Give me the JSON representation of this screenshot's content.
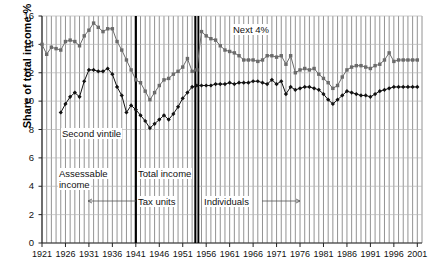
{
  "chart_data": {
    "type": "line",
    "title": "",
    "xlabel": "",
    "ylabel": "Share of total income %",
    "xlim": [
      1921,
      2002
    ],
    "ylim": [
      0,
      16
    ],
    "ytick_step": 2,
    "yticks": [
      "0",
      "2",
      "4",
      "6",
      "8",
      "10",
      "12",
      "14",
      "16"
    ],
    "xticks": [
      "1921",
      "1926",
      "1931",
      "1936",
      "1941",
      "1946",
      "1951",
      "1956",
      "1961",
      "1966",
      "1971",
      "1976",
      "1981",
      "1986",
      "1991",
      "1996",
      "2001"
    ],
    "grid": "vertical yearly gridlines plus horizontal gridlines at every y tick",
    "legend_position": "inline labels on series",
    "series": [
      {
        "name": "Next 4%",
        "marker": "square",
        "color": "#6b6b6b",
        "x": [
          1921,
          1922,
          1923,
          1924,
          1925,
          1926,
          1927,
          1928,
          1929,
          1930,
          1931,
          1932,
          1933,
          1934,
          1935,
          1936,
          1937,
          1938,
          1939,
          1940,
          1941,
          1942,
          1943,
          1944,
          1945,
          1946,
          1947,
          1948,
          1949,
          1950,
          1951,
          1952,
          1953,
          1954,
          1955,
          1956,
          1957,
          1958,
          1959,
          1960,
          1961,
          1962,
          1963,
          1964,
          1965,
          1966,
          1967,
          1968,
          1969,
          1970,
          1971,
          1972,
          1973,
          1974,
          1975,
          1976,
          1977,
          1978,
          1979,
          1980,
          1981,
          1982,
          1983,
          1984,
          1985,
          1986,
          1987,
          1988,
          1989,
          1990,
          1991,
          1992,
          1993,
          1994,
          1995,
          1996,
          1997,
          1998,
          1999,
          2000,
          2001
        ],
        "values": [
          14.0,
          13.3,
          13.8,
          13.7,
          13.6,
          14.2,
          14.3,
          14.2,
          13.9,
          14.6,
          15.0,
          15.5,
          15.2,
          14.9,
          15.1,
          15.1,
          14.2,
          13.6,
          12.9,
          12.2,
          11.5,
          11.3,
          10.7,
          10.1,
          10.6,
          11.1,
          11.5,
          11.6,
          11.9,
          12.1,
          12.4,
          13.0,
          12.1,
          12.2,
          14.9,
          14.6,
          14.4,
          14.3,
          13.9,
          13.6,
          13.5,
          13.4,
          13.2,
          12.9,
          12.9,
          12.9,
          12.8,
          12.9,
          13.2,
          13.2,
          13.1,
          13.2,
          12.6,
          13.2,
          12.0,
          12.2,
          12.3,
          12.2,
          12.3,
          11.9,
          11.6,
          11.3,
          10.9,
          11.1,
          11.7,
          12.2,
          12.4,
          12.5,
          12.5,
          12.4,
          12.3,
          12.5,
          12.6,
          12.9,
          13.4,
          12.8,
          12.9,
          12.9,
          12.9,
          12.9,
          12.9
        ]
      },
      {
        "name": "Second vintile",
        "marker": "diamond",
        "color": "#111111",
        "x": [
          1925,
          1926,
          1927,
          1928,
          1929,
          1930,
          1931,
          1932,
          1933,
          1934,
          1935,
          1936,
          1937,
          1938,
          1939,
          1940,
          1941,
          1942,
          1943,
          1944,
          1945,
          1946,
          1947,
          1948,
          1949,
          1950,
          1951,
          1952,
          1953,
          1954,
          1955,
          1956,
          1957,
          1958,
          1959,
          1960,
          1961,
          1962,
          1963,
          1964,
          1965,
          1966,
          1967,
          1968,
          1969,
          1970,
          1971,
          1972,
          1973,
          1974,
          1975,
          1976,
          1977,
          1978,
          1979,
          1980,
          1981,
          1982,
          1983,
          1984,
          1985,
          1986,
          1987,
          1988,
          1989,
          1990,
          1991,
          1992,
          1993,
          1994,
          1995,
          1996,
          1997,
          1998,
          1999,
          2000,
          2001
        ],
        "values": [
          9.2,
          9.8,
          10.3,
          10.6,
          10.3,
          11.4,
          12.2,
          12.2,
          12.1,
          12.1,
          12.3,
          11.9,
          11.0,
          10.4,
          9.2,
          9.7,
          9.4,
          9.0,
          8.6,
          8.1,
          8.4,
          8.7,
          9.0,
          8.7,
          9.1,
          9.6,
          10.2,
          10.6,
          11.0,
          11.1,
          11.1,
          11.1,
          11.1,
          11.2,
          11.2,
          11.2,
          11.3,
          11.2,
          11.3,
          11.3,
          11.3,
          11.4,
          11.4,
          11.3,
          11.2,
          11.5,
          11.2,
          11.4,
          10.5,
          11.0,
          10.8,
          10.9,
          11.0,
          11.0,
          10.9,
          10.8,
          10.5,
          10.1,
          9.8,
          10.1,
          10.4,
          10.7,
          10.6,
          10.5,
          10.4,
          10.4,
          10.3,
          10.5,
          10.7,
          10.8,
          10.9,
          11.0,
          11.0,
          11.0,
          11.0,
          11.0,
          11.0
        ]
      }
    ],
    "series_labels": [
      {
        "text": "Next 4%",
        "x_px": 232,
        "y_px": 24
      },
      {
        "text": "Second vintile",
        "x_px": 61,
        "y_px": 128
      }
    ],
    "period_annotations": [
      {
        "text": "Assessable",
        "x_px": 58,
        "y_px": 168
      },
      {
        "text": "income",
        "x_px": 58,
        "y_px": 179
      },
      {
        "text": "Total   income",
        "x_px": 137,
        "y_px": 168
      },
      {
        "text": "Tax  units",
        "x_px": 137,
        "y_px": 196
      },
      {
        "text": "Individuals",
        "x_px": 203,
        "y_px": 196
      }
    ],
    "vertical_markers": [
      {
        "year": 1941,
        "style": "thick-black"
      },
      {
        "year": 1954,
        "style": "double-thick-black"
      }
    ]
  }
}
